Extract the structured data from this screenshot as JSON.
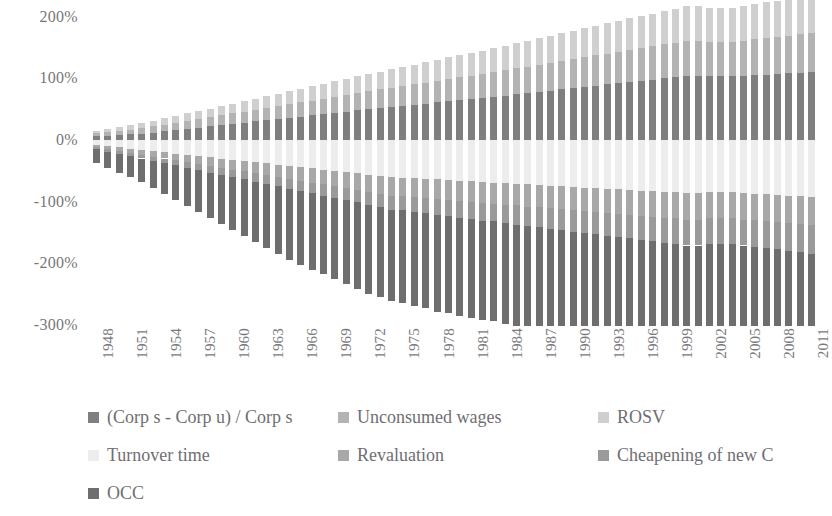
{
  "chart_data": {
    "type": "bar",
    "stacked": true,
    "title": "",
    "subtitle": "",
    "xlabel": "",
    "ylabel": "",
    "ylim": [
      -300,
      200
    ],
    "yticks": [
      200,
      100,
      0,
      -100,
      -200,
      -300
    ],
    "ytick_labels": [
      "200%",
      "100%",
      "0%",
      "-100%",
      "-200%",
      "-300%"
    ],
    "grid": false,
    "legend_position": "bottom",
    "x_tick_step": 3,
    "x_first_label": 1948,
    "x_last_label": 2011,
    "categories": [
      1948,
      1949,
      1950,
      1951,
      1952,
      1953,
      1954,
      1955,
      1956,
      1957,
      1958,
      1959,
      1960,
      1961,
      1962,
      1963,
      1964,
      1965,
      1966,
      1967,
      1968,
      1969,
      1970,
      1971,
      1972,
      1973,
      1974,
      1975,
      1976,
      1977,
      1978,
      1979,
      1980,
      1981,
      1982,
      1983,
      1984,
      1985,
      1986,
      1987,
      1988,
      1989,
      1990,
      1991,
      1992,
      1993,
      1994,
      1995,
      1996,
      1997,
      1998,
      1999,
      2000,
      2001,
      2002,
      2003,
      2004,
      2005,
      2006,
      2007,
      2008,
      2009,
      2010,
      2011
    ],
    "tick_labels": [
      "1948",
      "1951",
      "1954",
      "1957",
      "1960",
      "1963",
      "1966",
      "1969",
      "1972",
      "1975",
      "1978",
      "1981",
      "1984",
      "1987",
      "1990",
      "1993",
      "1996",
      "1999",
      "2002",
      "2005",
      "2008",
      "2011"
    ],
    "series": [
      {
        "name": "(Corp s - Corp u) / Corp s",
        "color": "#7f7f7f",
        "values": [
          6,
          7,
          8,
          9,
          10,
          12,
          14,
          16,
          18,
          20,
          22,
          24,
          26,
          28,
          30,
          32,
          34,
          36,
          38,
          40,
          42,
          44,
          46,
          48,
          50,
          52,
          54,
          55,
          57,
          59,
          61,
          63,
          65,
          66,
          68,
          70,
          72,
          74,
          76,
          78,
          80,
          82,
          84,
          86,
          88,
          90,
          92,
          94,
          96,
          98,
          100,
          102,
          104,
          104,
          103,
          103,
          103,
          104,
          105,
          106,
          107,
          108,
          109,
          110
        ]
      },
      {
        "name": "Unconsumed wages",
        "color": "#b3b3b3",
        "values": [
          5,
          6,
          7,
          8,
          9,
          10,
          11,
          12,
          13,
          14,
          15,
          16,
          17,
          18,
          19,
          20,
          21,
          22,
          23,
          24,
          25,
          26,
          27,
          28,
          29,
          30,
          31,
          32,
          33,
          34,
          35,
          36,
          37,
          38,
          39,
          40,
          41,
          42,
          43,
          44,
          45,
          46,
          47,
          48,
          49,
          50,
          51,
          52,
          53,
          54,
          55,
          56,
          57,
          57,
          56,
          56,
          56,
          57,
          58,
          59,
          60,
          61,
          62,
          63
        ]
      },
      {
        "name": "ROSV",
        "color": "#cfcfcf",
        "values": [
          4,
          5,
          6,
          7,
          8,
          9,
          10,
          11,
          12,
          13,
          14,
          15,
          16,
          17,
          18,
          19,
          20,
          21,
          22,
          23,
          24,
          25,
          26,
          27,
          28,
          29,
          30,
          31,
          32,
          33,
          34,
          35,
          36,
          37,
          38,
          39,
          40,
          41,
          42,
          43,
          44,
          45,
          46,
          47,
          48,
          49,
          50,
          51,
          52,
          53,
          54,
          55,
          56,
          56,
          55,
          55,
          55,
          56,
          57,
          58,
          59,
          60,
          61,
          62
        ]
      },
      {
        "name": "Turnover time",
        "color": "#ededed",
        "values": [
          -8,
          -10,
          -12,
          -14,
          -16,
          -18,
          -20,
          -22,
          -24,
          -26,
          -28,
          -30,
          -32,
          -34,
          -36,
          -38,
          -40,
          -42,
          -44,
          -46,
          -48,
          -50,
          -52,
          -54,
          -56,
          -58,
          -60,
          -61,
          -62,
          -63,
          -64,
          -65,
          -66,
          -67,
          -68,
          -69,
          -70,
          -71,
          -72,
          -73,
          -74,
          -75,
          -76,
          -77,
          -78,
          -79,
          -80,
          -81,
          -82,
          -83,
          -84,
          -85,
          -86,
          -86,
          -85,
          -85,
          -85,
          -86,
          -87,
          -88,
          -89,
          -90,
          -91,
          -92
        ]
      },
      {
        "name": "Revaluation",
        "color": "#a8a8a8",
        "values": [
          -4,
          -5,
          -6,
          -7,
          -8,
          -9,
          -10,
          -11,
          -12,
          -13,
          -14,
          -15,
          -16,
          -17,
          -18,
          -19,
          -20,
          -21,
          -22,
          -23,
          -24,
          -25,
          -26,
          -27,
          -28,
          -29,
          -30,
          -30,
          -31,
          -31,
          -32,
          -32,
          -33,
          -33,
          -34,
          -34,
          -35,
          -35,
          -36,
          -36,
          -37,
          -37,
          -38,
          -38,
          -39,
          -39,
          -40,
          -40,
          -41,
          -41,
          -42,
          -42,
          -43,
          -43,
          -42,
          -42,
          -42,
          -43,
          -43,
          -44,
          -44,
          -45,
          -45,
          -46
        ]
      },
      {
        "name": "Cheapening of new C",
        "color": "#9a9a9a",
        "values": [
          -3,
          -4,
          -5,
          -5,
          -6,
          -7,
          -8,
          -8,
          -9,
          -10,
          -11,
          -11,
          -12,
          -13,
          -14,
          -14,
          -15,
          -16,
          -17,
          -17,
          -18,
          -19,
          -20,
          -20,
          -21,
          -22,
          -23,
          -23,
          -24,
          -25,
          -26,
          -26,
          -27,
          -28,
          -29,
          -29,
          -30,
          -31,
          -32,
          -32,
          -33,
          -34,
          -35,
          -35,
          -36,
          -37,
          -38,
          -38,
          -39,
          -40,
          -41,
          -41,
          -42,
          -42,
          -41,
          -41,
          -41,
          -42,
          -43,
          -43,
          -44,
          -45,
          -45,
          -46
        ]
      },
      {
        "name": "OCC",
        "color": "#6e6e6e",
        "values": [
          -22,
          -26,
          -30,
          -34,
          -38,
          -44,
          -50,
          -56,
          -62,
          -68,
          -74,
          -80,
          -86,
          -92,
          -98,
          -104,
          -110,
          -116,
          -120,
          -124,
          -128,
          -132,
          -136,
          -140,
          -144,
          -146,
          -148,
          -150,
          -152,
          -154,
          -156,
          -158,
          -160,
          -160,
          -161,
          -162,
          -164,
          -166,
          -168,
          -170,
          -172,
          -174,
          -176,
          -172,
          -168,
          -166,
          -168,
          -172,
          -176,
          -180,
          -184,
          -188,
          -192,
          -186,
          -178,
          -172,
          -168,
          -172,
          -176,
          -180,
          -184,
          -172,
          -176,
          -180
        ]
      }
    ]
  },
  "legend": {
    "items": [
      {
        "label": "(Corp s - Corp u) / Corp s",
        "color": "#7f7f7f"
      },
      {
        "label": "Unconsumed wages",
        "color": "#b3b3b3"
      },
      {
        "label": "ROSV",
        "color": "#cfcfcf"
      },
      {
        "label": "Turnover time",
        "color": "#ededed"
      },
      {
        "label": "Revaluation",
        "color": "#a8a8a8"
      },
      {
        "label": "Cheapening of new C",
        "color": "#9a9a9a"
      },
      {
        "label": "OCC",
        "color": "#6e6e6e"
      }
    ]
  }
}
